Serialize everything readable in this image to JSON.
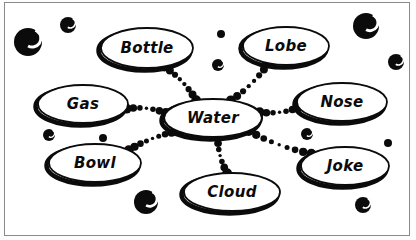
{
  "diagram": {
    "style": "hand-drawn bubble mind map",
    "background_color": "#ffffff",
    "ink_color": "#0b0b0b",
    "border_color": "#8a8a8a",
    "center": {
      "id": "water",
      "label": "Water",
      "cx": 213,
      "cy": 118,
      "rx": 49,
      "ry": 19,
      "font_size": 15
    },
    "nodes": [
      {
        "id": "bottle",
        "label": "Bottle",
        "cx": 147,
        "cy": 48,
        "rx": 46,
        "ry": 20,
        "font_size": 15
      },
      {
        "id": "lobe",
        "label": "Lobe",
        "cx": 286,
        "cy": 46,
        "rx": 43,
        "ry": 19,
        "font_size": 15
      },
      {
        "id": "gas",
        "label": "Gas",
        "cx": 83,
        "cy": 104,
        "rx": 45,
        "ry": 19,
        "font_size": 15
      },
      {
        "id": "nose",
        "label": "Nose",
        "cx": 342,
        "cy": 102,
        "rx": 45,
        "ry": 19,
        "font_size": 15
      },
      {
        "id": "bowl",
        "label": "Bowl",
        "cx": 95,
        "cy": 163,
        "rx": 46,
        "ry": 19,
        "font_size": 15
      },
      {
        "id": "joke",
        "label": "Joke",
        "cx": 345,
        "cy": 166,
        "rx": 44,
        "ry": 19,
        "font_size": 15
      },
      {
        "id": "cloud",
        "label": "Cloud",
        "cx": 232,
        "cy": 192,
        "rx": 48,
        "ry": 19,
        "font_size": 15
      }
    ],
    "edges": [
      {
        "from": "water",
        "to": "bottle",
        "dots": 7
      },
      {
        "from": "water",
        "to": "lobe",
        "dots": 7
      },
      {
        "from": "water",
        "to": "gas",
        "dots": 6
      },
      {
        "from": "water",
        "to": "nose",
        "dots": 6
      },
      {
        "from": "water",
        "to": "bowl",
        "dots": 8
      },
      {
        "from": "water",
        "to": "joke",
        "dots": 8
      },
      {
        "from": "water",
        "to": "cloud",
        "dots": 6
      }
    ],
    "bubbles": [
      {
        "cx": 28,
        "cy": 42,
        "r": 14
      },
      {
        "cx": 68,
        "cy": 25,
        "r": 8
      },
      {
        "cx": 221,
        "cy": 34,
        "r": 4
      },
      {
        "cx": 218,
        "cy": 65,
        "r": 6
      },
      {
        "cx": 366,
        "cy": 26,
        "r": 13
      },
      {
        "cx": 396,
        "cy": 62,
        "r": 8
      },
      {
        "cx": 49,
        "cy": 135,
        "r": 6
      },
      {
        "cx": 103,
        "cy": 138,
        "r": 4
      },
      {
        "cx": 146,
        "cy": 202,
        "r": 12
      },
      {
        "cx": 307,
        "cy": 134,
        "r": 6
      },
      {
        "cx": 388,
        "cy": 143,
        "r": 4
      },
      {
        "cx": 363,
        "cy": 205,
        "r": 8
      }
    ]
  }
}
